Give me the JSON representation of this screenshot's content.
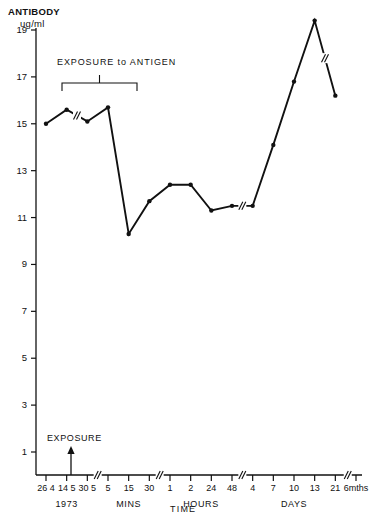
{
  "chart_data": {
    "type": "line",
    "title": "",
    "ylabel": "ANTIBODY",
    "yunits": "ug/ml",
    "xlabel": "TIME",
    "ylim": [
      0,
      19.9
    ],
    "yticks": [
      1,
      3,
      5,
      7,
      9,
      11,
      13,
      15,
      17,
      19
    ],
    "grid": false,
    "legend": null,
    "x_tick_labels": [
      "26 4",
      "14 5",
      "30 5",
      "5",
      "15",
      "30",
      "1",
      "2",
      "24",
      "48",
      "4",
      "7",
      "10",
      "13",
      "21",
      "6mths"
    ],
    "x_group_labels": [
      "1973",
      "MINS",
      "HOURS",
      "DAYS"
    ],
    "values": [
      15.0,
      15.6,
      15.1,
      15.7,
      10.3,
      11.7,
      12.4,
      12.4,
      11.3,
      11.5,
      11.5,
      14.1,
      16.8,
      19.4,
      16.2
    ],
    "categories": [
      "26 4",
      "14 5",
      "30 5",
      "5",
      "15",
      "30",
      "1",
      "2",
      "24",
      "48",
      "4",
      "7",
      "10",
      "13",
      "21"
    ],
    "axis_breaks": [
      "after 30 5",
      "after 30 mins",
      "after 48 hours",
      "after 21 days"
    ],
    "line_breaks": [
      "between 14 5 and 30 5",
      "between 48 and 4",
      "between 21 and 6mths"
    ],
    "annotations": [
      {
        "name": "exposure-to-antigen",
        "text": "EXPOSURE to ANTIGEN",
        "bracket": true
      },
      {
        "name": "exposure-arrow",
        "text": "EXPOSURE",
        "arrow": "up",
        "at": "30 5"
      }
    ]
  },
  "ylabels": {
    "title": "ANTIBODY",
    "units": "ug/ml"
  },
  "xaxis": {
    "title": "TIME"
  },
  "annotations": {
    "exposure_antigen": "EXPOSURE to ANTIGEN",
    "exposure": "EXPOSURE"
  },
  "caption": ""
}
